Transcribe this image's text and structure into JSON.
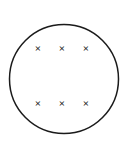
{
  "figure": {
    "background_color": "#ffffff",
    "width": 133,
    "height": 159,
    "boundary": {
      "shape": "circle",
      "label": "field-region-boundary",
      "center_x": 64,
      "center_y": 79,
      "radius": 54.5,
      "stroke_color": "#1b1b1b",
      "stroke_width": 1.5,
      "fill_color": "none"
    },
    "marks": {
      "glyph": "×",
      "semantic": "field-into-page",
      "color": "#1b1b1b",
      "count": 6,
      "rows": 2,
      "columns": 3,
      "items": [
        {
          "id": "mark-r1c1",
          "glyph": "×",
          "x": 38,
          "y": 48
        },
        {
          "id": "mark-r1c2",
          "glyph": "×",
          "x": 62,
          "y": 48
        },
        {
          "id": "mark-r1c3",
          "glyph": "×",
          "x": 86,
          "y": 48
        },
        {
          "id": "mark-r2c1",
          "glyph": "×",
          "x": 38,
          "y": 103
        },
        {
          "id": "mark-r2c2",
          "glyph": "×",
          "x": 62,
          "y": 103
        },
        {
          "id": "mark-r2c3",
          "glyph": "×",
          "x": 86,
          "y": 103
        }
      ]
    }
  }
}
